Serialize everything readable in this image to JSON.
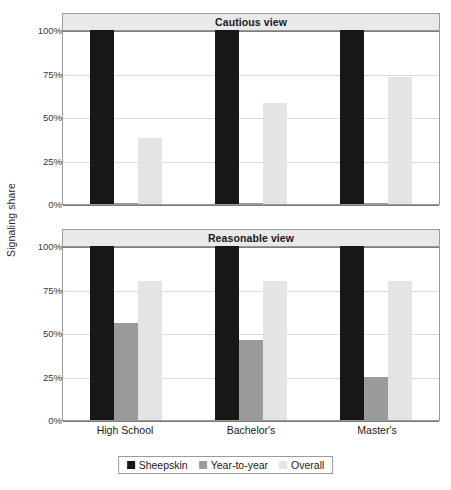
{
  "chart_data": {
    "type": "bar",
    "title": "",
    "xlabel": "",
    "ylabel": "Signaling share",
    "ylim": [
      0,
      100
    ],
    "ytick_labels": [
      "100%",
      "75%",
      "50%",
      "25%",
      "0%"
    ],
    "ytick_values": [
      100,
      75,
      50,
      25,
      0
    ],
    "grid": true,
    "legend_position": "bottom",
    "categories": [
      "High School",
      "Bachelor's",
      "Master's"
    ],
    "panels": [
      {
        "title": "Cautious view",
        "series": [
          {
            "name": "Sheepskin",
            "values": [
              100,
              100,
              100
            ]
          },
          {
            "name": "Year-to-year",
            "values": [
              0,
              0,
              0
            ]
          },
          {
            "name": "Overall",
            "values": [
              38,
              58,
              73
            ]
          }
        ]
      },
      {
        "title": "Reasonable view",
        "series": [
          {
            "name": "Sheepskin",
            "values": [
              100,
              100,
              100
            ]
          },
          {
            "name": "Year-to-year",
            "values": [
              56,
              46,
              25
            ]
          },
          {
            "name": "Overall",
            "values": [
              80,
              80,
              80
            ]
          }
        ]
      }
    ],
    "legend": [
      {
        "label": "Sheepskin",
        "color": "#171717"
      },
      {
        "label": "Year-to-year",
        "color": "#9b9b9b"
      },
      {
        "label": "Overall",
        "color": "#e4e4e4"
      }
    ]
  }
}
